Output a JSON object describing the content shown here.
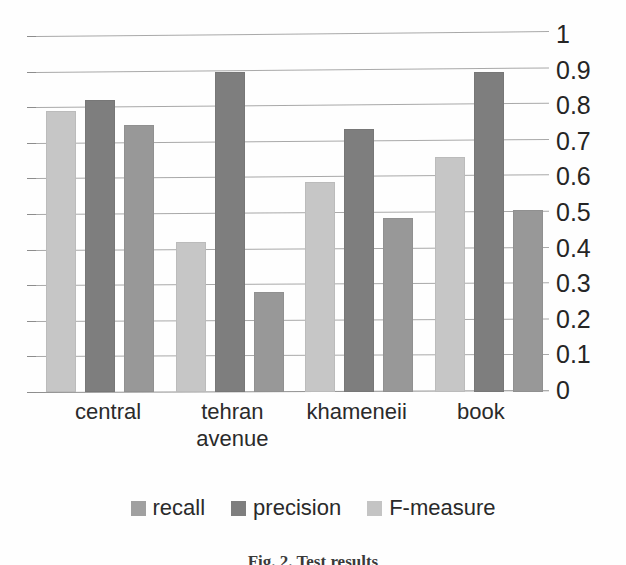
{
  "chart_data": {
    "type": "bar",
    "title": "",
    "subtitle": "",
    "xlabel": "",
    "ylabel": "",
    "ylim": [
      0,
      1
    ],
    "ytick_step": 0.1,
    "grid": true,
    "legend_position": "bottom",
    "categories": [
      "central",
      "tehran avenue",
      "khameneii",
      "book"
    ],
    "category_lines": [
      [
        "central"
      ],
      [
        "tehran",
        "avenue"
      ],
      [
        "khameneii"
      ],
      [
        "book"
      ]
    ],
    "ytick_labels": [
      "1",
      "0.9",
      "0.8",
      "0.7",
      "0.6",
      "0.5",
      "0.4",
      "0.3",
      "0.2",
      "0.1",
      "0"
    ],
    "ytick_values": [
      1,
      0.9,
      0.8,
      0.7,
      0.6,
      0.5,
      0.4,
      0.3,
      0.2,
      0.1,
      0
    ],
    "series": [
      {
        "name": "recall",
        "color": "#c6c6c6",
        "legend_color": "#a0a0a0",
        "values": [
          0.79,
          0.42,
          0.59,
          0.66
        ]
      },
      {
        "name": "precision",
        "color": "#7e7e7e",
        "legend_color": "#7e7e7e",
        "values": [
          0.82,
          0.9,
          0.74,
          0.9
        ]
      },
      {
        "name": "F-measure",
        "color": "#989898",
        "legend_color": "#c4c4c4",
        "values": [
          0.75,
          0.28,
          0.49,
          0.51
        ]
      }
    ]
  },
  "legend": {
    "items": [
      {
        "label": "recall"
      },
      {
        "label": "precision"
      },
      {
        "label": "F-measure"
      }
    ]
  },
  "caption": {
    "text": "Fig. 2.  Test results",
    "note": "cut off at bottom edge"
  }
}
